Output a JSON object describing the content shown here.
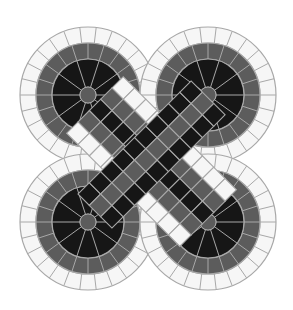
{
  "image": {
    "subject": "Celtic knot mosaic",
    "description": "Four-lobed interlaced knot made of square tiles in white, gray and black bands",
    "width": 293,
    "height": 310
  },
  "colors": {
    "background": "#ffffff",
    "white_tile": "#f6f6f6",
    "gray_tile": "#5c5c5c",
    "black_tile": "#161616",
    "grout": "#a8a8a8"
  },
  "lobes": [
    {
      "name": "top-left",
      "cx": 88,
      "cy": 95
    },
    {
      "name": "top-right",
      "cx": 208,
      "cy": 95
    },
    {
      "name": "bottom-left",
      "cx": 88,
      "cy": 222
    },
    {
      "name": "bottom-right",
      "cx": 208,
      "cy": 222
    }
  ],
  "rings": {
    "outer_radius": 68,
    "white_inner_radius": 52,
    "gray_inner_radius": 36,
    "black_inner_radius": 8
  }
}
